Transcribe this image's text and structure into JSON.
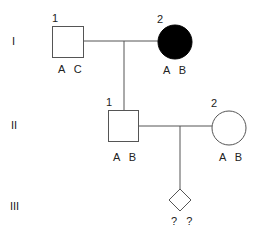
{
  "diagram": {
    "type": "pedigree",
    "colors": {
      "line": "#555555",
      "affected_fill": "#000000",
      "unaffected_fill": "#ffffff"
    },
    "generations": [
      {
        "label": "I"
      },
      {
        "label": "II"
      },
      {
        "label": "III"
      }
    ],
    "individuals": {
      "I_1": {
        "number": "1",
        "sex": "male",
        "shape": "square",
        "affected": false,
        "genotype": "A C"
      },
      "I_2": {
        "number": "2",
        "sex": "female",
        "shape": "circle",
        "affected": true,
        "genotype": "A B"
      },
      "II_1": {
        "number": "1",
        "sex": "male",
        "shape": "square",
        "affected": false,
        "genotype": "A B"
      },
      "II_2": {
        "number": "2",
        "sex": "female",
        "shape": "circle",
        "affected": false,
        "genotype": "A B"
      },
      "III_1": {
        "number": "",
        "sex": "unknown",
        "shape": "diamond",
        "affected": false,
        "genotype": "? ?"
      }
    }
  }
}
